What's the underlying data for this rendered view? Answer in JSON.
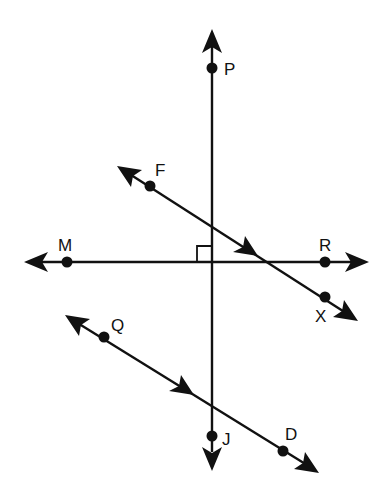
{
  "diagram": {
    "colors": {
      "stroke": "#111111",
      "background": "#ffffff"
    },
    "lines": [
      {
        "id": "PJ",
        "description": "vertical line through P and J",
        "from": [
          212,
          28
        ],
        "to": [
          212,
          470
        ]
      },
      {
        "id": "MR",
        "description": "horizontal line through M and R",
        "from": [
          25,
          262
        ],
        "to": [
          368,
          262
        ]
      },
      {
        "id": "FX",
        "description": "transversal line through F and X",
        "from": [
          118,
          167
        ],
        "to": [
          357,
          320
        ]
      },
      {
        "id": "QD",
        "description": "line through Q and D, parallel to FX",
        "from": [
          66,
          316
        ],
        "to": [
          318,
          472
        ]
      }
    ],
    "points": [
      {
        "label": "P",
        "x": 212,
        "y": 68,
        "label_x": 224,
        "label_y": 75
      },
      {
        "label": "F",
        "x": 150,
        "y": 186,
        "label_x": 155,
        "label_y": 176
      },
      {
        "label": "M",
        "x": 67,
        "y": 262,
        "label_x": 59,
        "label_y": 250
      },
      {
        "label": "R",
        "x": 325,
        "y": 262,
        "label_x": 319,
        "label_y": 250
      },
      {
        "label": "X",
        "x": 325,
        "y": 297,
        "label_x": 315,
        "label_y": 322
      },
      {
        "label": "Q",
        "x": 104,
        "y": 337,
        "label_x": 111,
        "label_y": 331
      },
      {
        "label": "J",
        "x": 212,
        "y": 436,
        "label_x": 222,
        "label_y": 444
      },
      {
        "label": "D",
        "x": 283,
        "y": 451,
        "label_x": 285,
        "label_y": 440
      }
    ],
    "right_angle_marker": {
      "at": [
        212,
        262
      ],
      "size": 15,
      "quadrant": "upper-left"
    },
    "parallel_marks": [
      {
        "line": "FX",
        "at": [
          247,
          249
        ]
      },
      {
        "line": "QD",
        "at": [
          183,
          389
        ]
      }
    ]
  }
}
